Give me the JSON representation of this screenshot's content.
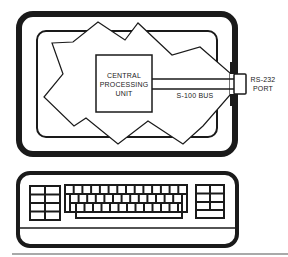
{
  "diagram": {
    "components": {
      "cpu": {
        "label_line1": "CENTRAL",
        "label_line2": "PROCESSING",
        "label_line3": "UNIT"
      },
      "bus": {
        "label": "S-100 BUS"
      },
      "port": {
        "label_line1": "RS-232",
        "label_line2": "PORT"
      },
      "monitor": {
        "name": "monitor"
      },
      "keyboard": {
        "name": "keyboard",
        "left_keypad": {
          "rows": 4,
          "cols": 2
        },
        "main_keys": {
          "rows": 3,
          "cols": 14
        },
        "right_keypad": {
          "rows": 3,
          "cols": 2
        }
      }
    },
    "colors": {
      "ink": "#1a1a1a",
      "background": "#ffffff"
    }
  }
}
